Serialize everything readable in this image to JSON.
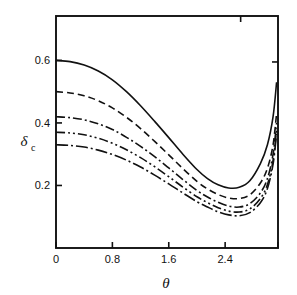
{
  "figure": {
    "background_color": "#ffffff",
    "line_color": "#111111",
    "frame": {
      "left": 56,
      "right": 278,
      "top": 16,
      "bottom": 248
    }
  },
  "chart_data": {
    "type": "line",
    "title": "",
    "subtitle": "",
    "xlabel": "θ",
    "ylabel": "δ",
    "ylabel_subscript": "c",
    "xlim": [
      0.0,
      3.15
    ],
    "ylim": [
      0.0,
      0.742
    ],
    "grid": false,
    "legend": "none",
    "xticks": [
      0,
      0.8,
      1.6,
      2.4
    ],
    "xtick_labels": [
      "0",
      "0.8",
      "1.6",
      "2.4"
    ],
    "yticks": [
      0.2,
      0.4,
      0.6
    ],
    "ytick_labels": [
      "0.2",
      "0.4",
      "0.6"
    ],
    "minor_xticks": [
      3.2
    ],
    "top_ticks": [
      2.62
    ],
    "right_ticks": [
      0.595
    ],
    "series": [
      {
        "name": "curve-1",
        "style": "solid",
        "dasharray": "none",
        "x": [
          0.0,
          0.2,
          0.4,
          0.6,
          0.8,
          1.0,
          1.2,
          1.4,
          1.6,
          1.8,
          2.0,
          2.15,
          2.3,
          2.45,
          2.6,
          2.75,
          2.9,
          3.0,
          3.08,
          3.13
        ],
        "y": [
          0.6,
          0.596,
          0.585,
          0.566,
          0.538,
          0.5,
          0.455,
          0.405,
          0.353,
          0.3,
          0.251,
          0.222,
          0.202,
          0.192,
          0.194,
          0.215,
          0.27,
          0.33,
          0.42,
          0.53
        ]
      },
      {
        "name": "curve-2",
        "style": "dashed",
        "dasharray": "7,4",
        "x": [
          0.0,
          0.2,
          0.4,
          0.6,
          0.8,
          1.0,
          1.2,
          1.4,
          1.6,
          1.8,
          2.0,
          2.15,
          2.3,
          2.45,
          2.6,
          2.75,
          2.9,
          3.0,
          3.08,
          3.13
        ],
        "y": [
          0.5,
          0.496,
          0.487,
          0.471,
          0.448,
          0.418,
          0.382,
          0.341,
          0.298,
          0.254,
          0.213,
          0.189,
          0.171,
          0.16,
          0.158,
          0.17,
          0.208,
          0.255,
          0.33,
          0.43
        ]
      },
      {
        "name": "curve-3",
        "style": "dash-dot",
        "dasharray": "9,3,2,3",
        "x": [
          0.0,
          0.2,
          0.4,
          0.6,
          0.8,
          1.0,
          1.2,
          1.4,
          1.6,
          1.8,
          2.0,
          2.15,
          2.3,
          2.45,
          2.6,
          2.75,
          2.9,
          3.0,
          3.08,
          3.13
        ],
        "y": [
          0.42,
          0.417,
          0.41,
          0.397,
          0.379,
          0.354,
          0.325,
          0.292,
          0.256,
          0.219,
          0.184,
          0.163,
          0.146,
          0.134,
          0.131,
          0.142,
          0.176,
          0.222,
          0.3,
          0.4
        ]
      },
      {
        "name": "curve-4",
        "style": "dash-dot-dot",
        "dasharray": "9,3,2,3,2,3",
        "x": [
          0.0,
          0.2,
          0.4,
          0.6,
          0.8,
          1.0,
          1.2,
          1.4,
          1.6,
          1.8,
          2.0,
          2.15,
          2.3,
          2.45,
          2.6,
          2.75,
          2.9,
          3.0,
          3.08,
          3.13
        ],
        "y": [
          0.37,
          0.368,
          0.362,
          0.351,
          0.335,
          0.314,
          0.289,
          0.26,
          0.228,
          0.195,
          0.164,
          0.145,
          0.129,
          0.118,
          0.115,
          0.125,
          0.158,
          0.203,
          0.28,
          0.378
        ]
      },
      {
        "name": "curve-5",
        "style": "long-dash-dot",
        "dasharray": "12,3,2,3",
        "x": [
          0.0,
          0.2,
          0.4,
          0.6,
          0.8,
          1.0,
          1.2,
          1.4,
          1.6,
          1.8,
          2.0,
          2.15,
          2.3,
          2.45,
          2.6,
          2.75,
          2.9,
          3.0,
          3.08,
          3.13
        ],
        "y": [
          0.33,
          0.328,
          0.323,
          0.313,
          0.299,
          0.281,
          0.259,
          0.233,
          0.205,
          0.176,
          0.148,
          0.131,
          0.116,
          0.106,
          0.103,
          0.113,
          0.145,
          0.19,
          0.268,
          0.365
        ]
      }
    ]
  }
}
